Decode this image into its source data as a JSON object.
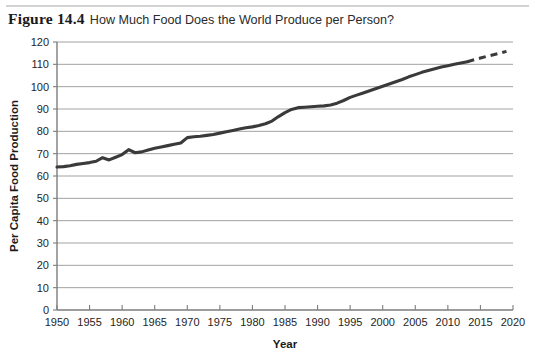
{
  "figure": {
    "number_label": "Figure 14.4",
    "title": "How Much Food Does the World Produce per Person?"
  },
  "chart_data": {
    "type": "line",
    "title": "How Much Food Does the World Produce per Person?",
    "xlabel": "Year",
    "ylabel": "Per Capita Food Production",
    "xlim": [
      1950,
      2020
    ],
    "ylim": [
      0,
      120
    ],
    "grid": true,
    "legend": null,
    "x_ticks": [
      1950,
      1955,
      1960,
      1965,
      1970,
      1975,
      1980,
      1985,
      1990,
      1995,
      2000,
      2005,
      2010,
      2015,
      2020
    ],
    "y_ticks": [
      0,
      10,
      20,
      30,
      40,
      50,
      60,
      70,
      80,
      90,
      100,
      110,
      120
    ],
    "series": [
      {
        "name": "Per capita food production (observed)",
        "style": "solid",
        "color": "#3a3a3a",
        "x": [
          1950,
          1951,
          1952,
          1953,
          1954,
          1955,
          1956,
          1957,
          1958,
          1959,
          1960,
          1961,
          1962,
          1963,
          1964,
          1965,
          1966,
          1967,
          1968,
          1969,
          1970,
          1971,
          1972,
          1973,
          1974,
          1975,
          1976,
          1977,
          1978,
          1979,
          1980,
          1981,
          1982,
          1983,
          1984,
          1985,
          1986,
          1987,
          1988,
          1989,
          1990,
          1991,
          1992,
          1993,
          1994,
          1995,
          1996,
          1997,
          1998,
          1999,
          2000,
          2001,
          2002,
          2003,
          2004,
          2005,
          2006,
          2007,
          2008,
          2009,
          2010,
          2011,
          2012,
          2013
        ],
        "y": [
          64.0,
          64.2,
          64.6,
          65.2,
          65.6,
          66.0,
          66.6,
          68.2,
          67.2,
          68.4,
          69.6,
          71.8,
          70.4,
          70.8,
          71.6,
          72.4,
          73.0,
          73.6,
          74.2,
          74.8,
          77.2,
          77.6,
          77.8,
          78.2,
          78.6,
          79.2,
          79.8,
          80.4,
          81.0,
          81.6,
          82.0,
          82.6,
          83.4,
          84.6,
          86.6,
          88.4,
          89.8,
          90.6,
          90.8,
          91.0,
          91.2,
          91.4,
          91.8,
          92.6,
          93.8,
          95.2,
          96.2,
          97.2,
          98.2,
          99.2,
          100.2,
          101.2,
          102.2,
          103.2,
          104.4,
          105.4,
          106.4,
          107.2,
          108.0,
          108.8,
          109.4,
          110.0,
          110.6,
          111.2
        ]
      },
      {
        "name": "Projection",
        "style": "dashed",
        "color": "#3a3a3a",
        "x": [
          2013,
          2014,
          2015,
          2016,
          2017,
          2018,
          2019
        ],
        "y": [
          111.2,
          112.0,
          112.8,
          113.6,
          114.3,
          115.0,
          115.8
        ]
      }
    ]
  }
}
